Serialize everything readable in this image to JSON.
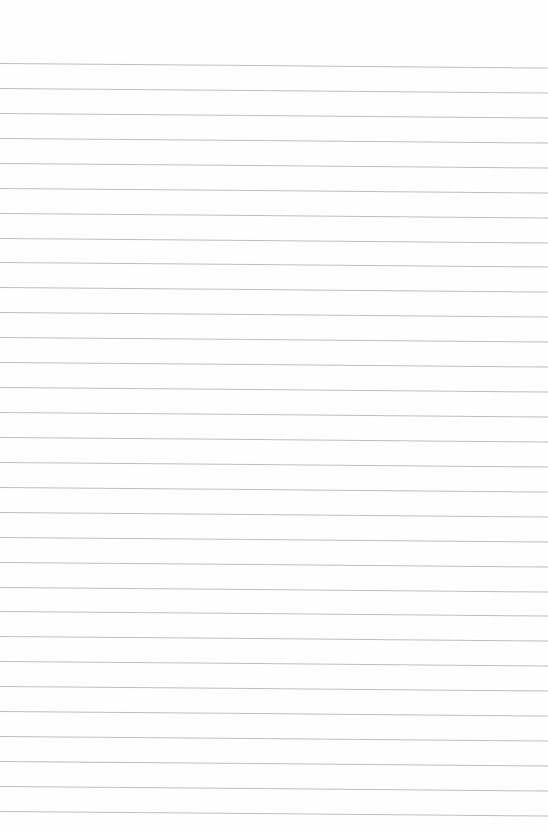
{
  "paper": {
    "background": "#fefefe",
    "line_color": "#bdbdbd",
    "line_count": 31,
    "first_line_y": 63,
    "line_spacing": 24.93,
    "tilt_px": 4.5
  }
}
